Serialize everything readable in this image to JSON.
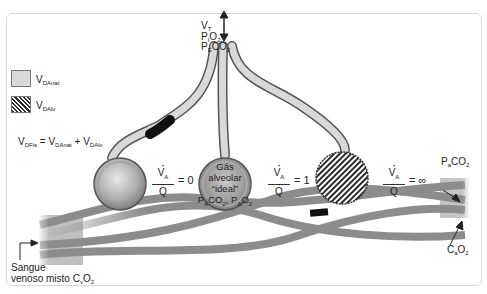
{
  "diagram": {
    "top_label": {
      "tidal_volume": "V",
      "tidal_volume_sub": "T",
      "inspired": "P",
      "inspired_sub": "I",
      "inspired_gas": "O",
      "inspired_gas_sub": "2",
      "expired": "P",
      "expired_sub": "E",
      "expired_gas": "CO",
      "expired_gas_sub": "2"
    },
    "legend": [
      {
        "symbol": "V",
        "subscript": "DAnat",
        "pattern": "solid-light-gray"
      },
      {
        "symbol": "V",
        "subscript": "DAlv",
        "pattern": "diagonal-hatch"
      }
    ],
    "equation": {
      "lhs": "V",
      "lhs_sub": "DFis",
      "eq": " = ",
      "t1": "V",
      "t1_sub": "DAnat",
      "plus": " + ",
      "t2": "V",
      "t2_sub": "DAlv"
    },
    "ratios": [
      {
        "numerator": "V",
        "numerator_sub": "A",
        "denominator": "Q",
        "value": "= 0"
      },
      {
        "numerator": "V",
        "numerator_sub": "A",
        "denominator": "Q",
        "value": "= 1"
      },
      {
        "numerator": "V",
        "numerator_sub": "A",
        "denominator": "Q",
        "value": "= ∞"
      }
    ],
    "ideal_alveolus": {
      "line1": "Gás",
      "line2": "alveolar",
      "line3": "“ideal”",
      "line4_a": "P",
      "line4_a_sub": "A",
      "line4_b": "CO",
      "line4_b_sub": "2",
      "line4_c": ", P",
      "line4_c_sub": "A",
      "line4_d": "O",
      "line4_d_sub": "2"
    },
    "arterial_pco2": {
      "p": "P",
      "sub": "a",
      "gas": "CO",
      "gas_sub": "2"
    },
    "arterial_co2": {
      "c": "C",
      "sub": "a",
      "gas": "O",
      "gas_sub": "2"
    },
    "venous": {
      "line1": "Sangue",
      "line2": "venoso misto C",
      "line2_sub": "v",
      "gas": "O",
      "gas_sub": "2"
    },
    "colors": {
      "airway_fill": "#d9d9d9",
      "airway_stroke": "#555555",
      "vessel": "#8c8c8c",
      "dead_space_block": "#111111",
      "frame": "#d8d8d8"
    }
  }
}
